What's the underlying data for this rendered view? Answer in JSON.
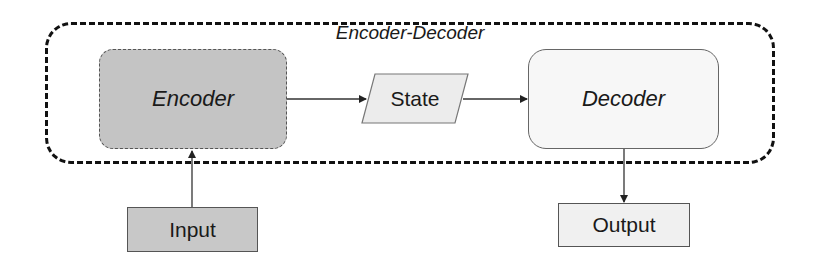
{
  "diagram": {
    "container": {
      "label": "Encoder-Decoder",
      "style": "dashed-rounded"
    },
    "nodes": {
      "encoder": {
        "label": "Encoder",
        "fill": "#c4c4c4",
        "border": "dotted"
      },
      "state": {
        "label": "State",
        "shape": "parallelogram",
        "fill": "#ececec"
      },
      "decoder": {
        "label": "Decoder",
        "fill": "#f7f7f7",
        "border": "solid"
      },
      "input": {
        "label": "Input",
        "fill": "#c8c8c8"
      },
      "output": {
        "label": "Output",
        "fill": "#f0f0f0"
      }
    },
    "edges": [
      {
        "from": "Input",
        "to": "Encoder"
      },
      {
        "from": "Encoder",
        "to": "State"
      },
      {
        "from": "State",
        "to": "Decoder"
      },
      {
        "from": "Decoder",
        "to": "Output"
      }
    ]
  }
}
